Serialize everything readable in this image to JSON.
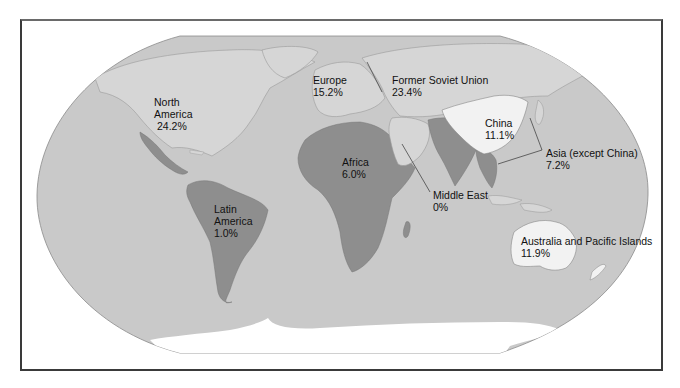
{
  "map": {
    "type": "world-choropleth",
    "projection": "robinson-like",
    "colors": {
      "ocean": "#c9c9c9",
      "land_light": "#d6d6d6",
      "land_dark": "#8e8e8e",
      "land_white": "#f2f2f2",
      "antarctica": "#ffffff",
      "frame": "#3a3a3a"
    },
    "regions": [
      {
        "id": "north-america",
        "name_line1": "North",
        "name_line2": "America",
        "value": "24.2%",
        "shade": "light"
      },
      {
        "id": "europe",
        "name": "Europe",
        "value": "15.2%",
        "shade": "light"
      },
      {
        "id": "former-soviet-union",
        "name": "Former Soviet Union",
        "value": "23.4%",
        "shade": "light"
      },
      {
        "id": "china",
        "name": "China",
        "value": "11.1%",
        "shade": "white"
      },
      {
        "id": "asia-except-china",
        "name": "Asia (except China)",
        "value": "7.2%",
        "shade": "dark"
      },
      {
        "id": "africa",
        "name": "Africa",
        "value": "6.0%",
        "shade": "dark"
      },
      {
        "id": "middle-east",
        "name": "Middle East",
        "value": "0%",
        "shade": "light"
      },
      {
        "id": "latin-america",
        "name_line1": "Latin",
        "name_line2": "America",
        "value": "1.0%",
        "shade": "dark"
      },
      {
        "id": "australia-pacific",
        "name": "Australia and Pacific Islands",
        "value": "11.9%",
        "shade": "white"
      }
    ]
  }
}
